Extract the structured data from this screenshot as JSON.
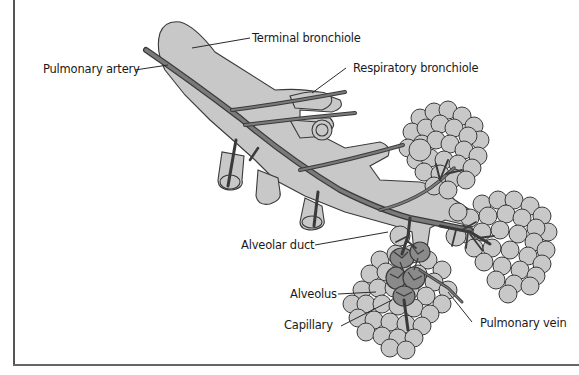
{
  "diagram": {
    "type": "anatomical-illustration",
    "colors": {
      "tissue_fill": "#c8c8c8",
      "outline": "#3a3a3a",
      "vessel": "#6e6e6e",
      "capillary_net": "#4a4a4a",
      "label_text": "#1a1a1a",
      "background": "#ffffff"
    },
    "labels": {
      "terminal_bronchiole": "Terminal bronchiole",
      "pulmonary_artery": "Pulmonary artery",
      "respiratory_bronchiole": "Respiratory bronchiole",
      "alveolar_duct": "Alveolar duct",
      "alveolus": "Alveolus",
      "capillary": "Capillary",
      "pulmonary_vein": "Pulmonary vein"
    }
  }
}
